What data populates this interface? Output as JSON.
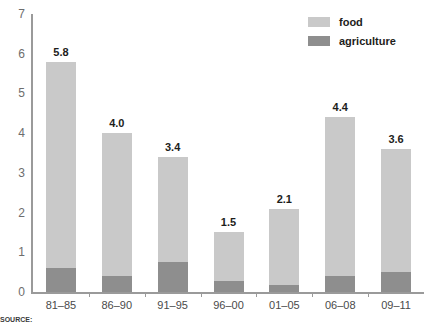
{
  "chart_data": {
    "type": "bar",
    "subtype": "stacked-bar",
    "title": "",
    "xlabel": "",
    "ylabel": "",
    "ylim": [
      0,
      7
    ],
    "yticks": [
      0,
      1,
      2,
      3,
      4,
      5,
      6,
      7
    ],
    "grid": false,
    "legend_position": "top-right",
    "categories": [
      "81–85",
      "86–90",
      "91–95",
      "96–00",
      "01–05",
      "06–08",
      "09–11"
    ],
    "series": [
      {
        "name": "agriculture",
        "color": "#8e8e8e",
        "values": [
          0.6,
          0.4,
          0.75,
          0.27,
          0.18,
          0.4,
          0.5
        ]
      },
      {
        "name": "food",
        "color": "#c9c9c9",
        "values": [
          5.2,
          3.6,
          2.65,
          1.23,
          1.92,
          4.0,
          3.1
        ]
      }
    ],
    "totals": [
      5.8,
      4.0,
      3.4,
      1.5,
      2.1,
      4.4,
      3.6
    ],
    "total_labels": [
      "5.8",
      "4.0",
      "3.4",
      "1.5",
      "2.1",
      "4.4",
      "3.6"
    ]
  },
  "axis": {
    "y_tick_labels": [
      "7",
      "6",
      "5",
      "4",
      "3",
      "2",
      "1",
      "0"
    ],
    "x_tick_labels": [
      "81–85",
      "86–90",
      "91–95",
      "96–00",
      "01–05",
      "06–08",
      "09–11"
    ]
  },
  "legend": {
    "items": [
      {
        "label": "food",
        "color": "#c9c9c9"
      },
      {
        "label": "agriculture",
        "color": "#8e8e8e"
      }
    ]
  },
  "title_sliver": "",
  "source_note": {
    "prefix": "SOURCE:",
    "text": ""
  },
  "colors": {
    "food": "#c9c9c9",
    "agriculture": "#8e8e8e",
    "axis": "#9a9a9a",
    "tick_text": "#6d6d6d",
    "label_text": "#1d1d1b",
    "background": "#ffffff"
  }
}
